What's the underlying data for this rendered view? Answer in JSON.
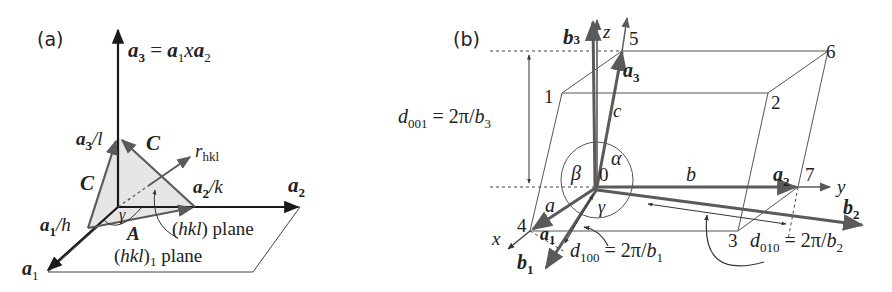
{
  "panels": [
    {
      "id": "a",
      "label": "(a)",
      "title_vector": {
        "lhs": "a",
        "lhs_sub": "3",
        "eq": " = ",
        "r1": "a",
        "r1_sub": "1",
        "x": "x",
        "r2": "a",
        "r2_sub": "2"
      },
      "axes": {
        "a1": {
          "main": "a",
          "sub": "1"
        },
        "a2": {
          "main": "a",
          "sub": "2"
        }
      },
      "intercepts": {
        "a1_h": {
          "main": "a",
          "sub": "1",
          "rest": "/h"
        },
        "a2_k": {
          "main": "a",
          "sub": "2",
          "rest": "/k"
        },
        "a3_l": {
          "main": "a",
          "sub": "3",
          "rest": "/l"
        }
      },
      "edge_labels": {
        "C_top": "C",
        "C_left": "C",
        "A_bottom": "A"
      },
      "normal": {
        "main": "r",
        "sub": "hkl"
      },
      "angle": "γ",
      "plane_label": {
        "open": "(",
        "hkl": "hkl",
        "close": ") plane"
      },
      "plane1_label": {
        "open": "(",
        "hkl": "hkl",
        "close": ")",
        "sub": "1",
        "rest": " plane"
      }
    },
    {
      "id": "b",
      "label": "(b)",
      "axes": {
        "x": "x",
        "y": "y",
        "z": "z"
      },
      "direct_vectors": {
        "a1": {
          "main": "a",
          "sub": "1"
        },
        "a2": {
          "main": "a",
          "sub": "2"
        },
        "a3": {
          "main": "a",
          "sub": "3"
        }
      },
      "reciprocal_vectors": {
        "b1": {
          "main": "b",
          "sub": "1"
        },
        "b2": {
          "main": "b",
          "sub": "2"
        },
        "b3": {
          "main": "b",
          "sub": "3"
        }
      },
      "lengths": {
        "a": "a",
        "b": "b",
        "c": "c"
      },
      "angles": {
        "alpha": "α",
        "beta": "β",
        "gamma": "γ"
      },
      "origin": "0",
      "vertices": [
        "1",
        "2",
        "3",
        "4",
        "5",
        "6",
        "7"
      ],
      "spacings": {
        "d001": {
          "d": "d",
          "sub": "001",
          "rhs": " = 2π/",
          "b": "b",
          "bsub": "3"
        },
        "d100": {
          "d": "d",
          "sub": "100",
          "rhs": " = 2π/",
          "b": "b",
          "bsub": "1"
        },
        "d010": {
          "d": "d",
          "sub": "010",
          "rhs": " = 2π/",
          "b": "b",
          "bsub": "2"
        }
      }
    }
  ],
  "colors": {
    "ink": "#1a1a1a",
    "gray_ink": "#5a5a5a",
    "plane_fill": "#e6e6e6",
    "thin_line": "#555555"
  }
}
